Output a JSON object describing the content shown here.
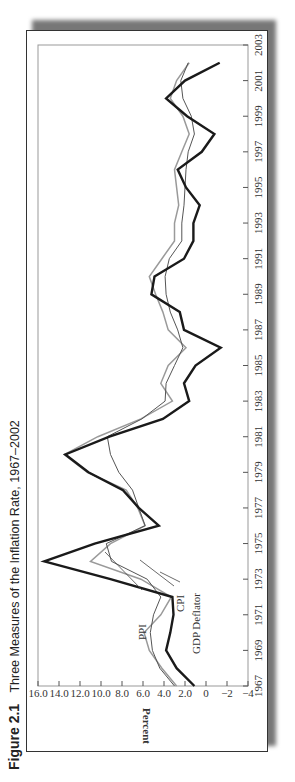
{
  "caption": {
    "figure_label": "Figure 2.1",
    "title": "Three Measures of the Inflation Rate, 1967–2002"
  },
  "chart_data": {
    "type": "line",
    "title": "Three Measures of the Inflation Rate, 1967–2002",
    "xlabel": "",
    "ylabel": "Percent",
    "x": [
      1967,
      1968,
      1969,
      1970,
      1971,
      1972,
      1973,
      1974,
      1975,
      1976,
      1977,
      1978,
      1979,
      1980,
      1981,
      1982,
      1983,
      1984,
      1985,
      1986,
      1987,
      1988,
      1989,
      1990,
      1991,
      1992,
      1993,
      1994,
      1995,
      1996,
      1997,
      1998,
      1999,
      2000,
      2001,
      2002
    ],
    "xticks": [
      "1967",
      "1969",
      "1971",
      "1973",
      "1975",
      "1977",
      "1979",
      "1981",
      "1983",
      "1985",
      "1987",
      "1989",
      "1991",
      "1993",
      "1995",
      "1997",
      "1999",
      "2001",
      "2003"
    ],
    "yticks": [
      "16.0",
      "14.0",
      "12.0",
      "10.0",
      "8.0",
      "6.0",
      "4.0",
      "2.0",
      "0",
      "−2",
      "−4"
    ],
    "ylim": [
      -4,
      16
    ],
    "xlim": [
      1967,
      2003
    ],
    "grid": false,
    "legend": "inline labels with leader lines",
    "series": [
      {
        "name": "PPI",
        "style": "thick black",
        "values": [
          1.1,
          2.8,
          3.8,
          3.4,
          3.1,
          3.2,
          9.1,
          15.4,
          10.6,
          4.5,
          6.4,
          7.9,
          11.2,
          13.4,
          9.2,
          4.1,
          1.6,
          2.1,
          1.0,
          -1.4,
          2.1,
          2.5,
          5.2,
          4.9,
          2.1,
          1.2,
          1.2,
          0.6,
          1.9,
          2.7,
          0.4,
          -0.8,
          1.8,
          3.8,
          2.0,
          -1.3
        ]
      },
      {
        "name": "CPI",
        "style": "medium gray",
        "values": [
          2.8,
          4.2,
          5.4,
          5.9,
          4.3,
          3.3,
          6.2,
          11.0,
          9.1,
          5.8,
          6.5,
          7.6,
          11.3,
          13.5,
          10.3,
          6.2,
          3.2,
          4.3,
          3.6,
          1.9,
          3.6,
          4.1,
          4.8,
          5.4,
          4.2,
          3.0,
          3.0,
          2.6,
          2.8,
          3.0,
          2.3,
          1.6,
          2.2,
          3.4,
          2.8,
          1.6
        ]
      },
      {
        "name": "GDP Deflator",
        "style": "thin dark gray",
        "values": [
          3.0,
          4.4,
          5.1,
          5.3,
          5.0,
          4.3,
          5.6,
          9.0,
          9.5,
          5.8,
          6.4,
          7.0,
          8.3,
          9.1,
          9.4,
          6.1,
          3.9,
          3.8,
          3.0,
          2.2,
          2.7,
          3.4,
          3.8,
          3.9,
          3.5,
          2.3,
          2.3,
          2.1,
          2.0,
          1.9,
          1.7,
          1.1,
          1.4,
          2.2,
          2.4,
          1.7
        ]
      }
    ]
  },
  "labels": {
    "ppi": "PPI",
    "cpi": "CPI",
    "gdp": "GDP Deflator",
    "ylabel": "Percent"
  }
}
